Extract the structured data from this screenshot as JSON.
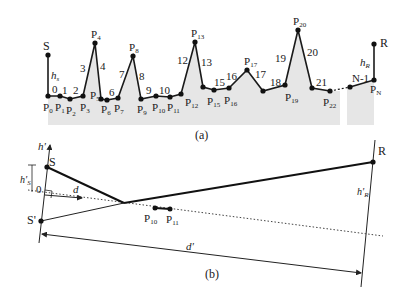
{
  "figure": {
    "panel_a": {
      "caption": "(a)",
      "source_label": "S",
      "receiver_label": "R",
      "source_height_label": "h",
      "source_height_sub": "s",
      "receiver_height_label": "h",
      "receiver_height_sub": "R",
      "points": [
        {
          "name": "P",
          "sub": "0"
        },
        {
          "name": "P",
          "sub": "1"
        },
        {
          "name": "P",
          "sub": "2"
        },
        {
          "name": "P",
          "sub": "3"
        },
        {
          "name": "P",
          "sub": "4"
        },
        {
          "name": "P",
          "sub": "5"
        },
        {
          "name": "P",
          "sub": "6"
        },
        {
          "name": "P",
          "sub": "7"
        },
        {
          "name": "P",
          "sub": "8"
        },
        {
          "name": "P",
          "sub": "9"
        },
        {
          "name": "P",
          "sub": "10"
        },
        {
          "name": "P",
          "sub": "11"
        },
        {
          "name": "P",
          "sub": "12"
        },
        {
          "name": "P",
          "sub": "13"
        },
        {
          "name": "P",
          "sub": "15"
        },
        {
          "name": "P",
          "sub": "16"
        },
        {
          "name": "P",
          "sub": "17"
        },
        {
          "name": "P",
          "sub": "19"
        },
        {
          "name": "P",
          "sub": "20"
        },
        {
          "name": "P",
          "sub": "22"
        },
        {
          "name": "P",
          "sub": "N"
        }
      ],
      "segments": [
        "0",
        "1",
        "2",
        "3",
        "4",
        "6",
        "7",
        "8",
        "9",
        "10",
        "12",
        "13",
        "15",
        "16",
        "17",
        "18",
        "19",
        "20",
        "21",
        "N-1"
      ]
    },
    "panel_b": {
      "caption": "(b)",
      "axis_label": "h'",
      "source_label": "S",
      "image_source_label": "S'",
      "receiver_label": "R",
      "origin_label": "0",
      "distance_label": "d",
      "distance_prime_label": "d'",
      "source_height_label": "h'",
      "source_height_sub": "S",
      "receiver_height_label": "h'",
      "receiver_height_sub": "R",
      "point_a": {
        "name": "P",
        "sub": "10"
      },
      "point_b": {
        "name": "P",
        "sub": "11"
      }
    }
  }
}
